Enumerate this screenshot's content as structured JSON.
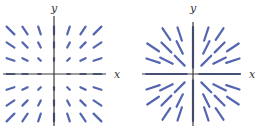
{
  "figure": {
    "panels": [
      {
        "id": "left",
        "title": "",
        "x_label": "x",
        "y_label": "y",
        "origin": [
          54,
          74
        ],
        "x_axis_range_px": [
          3,
          106
        ],
        "y_axis_range_px": [
          16,
          126
        ],
        "grid_spacing_px": 14.5,
        "grid_range": [
          -3,
          3
        ],
        "field": "F(x,y) = (x, y) scaled by magnitude",
        "scale_px": 2.6,
        "color": "#5566b0"
      },
      {
        "id": "right",
        "title": "",
        "x_label": "x",
        "y_label": "y",
        "origin": [
          193,
          74
        ],
        "x_axis_range_px": [
          142,
          241
        ],
        "y_axis_range_px": [
          22,
          126
        ],
        "grid_spacing_px": 14,
        "grid_range": [
          -3,
          3
        ],
        "field": "F(x,y) = (x, y) normalized (unit length)",
        "segment_length_px": 14,
        "max_radius": 3.7,
        "color": "#5566b0"
      }
    ]
  },
  "chart_data": [
    {
      "type": "vector_field",
      "title": "",
      "xlabel": "x",
      "ylabel": "y",
      "field": "radial (x, y), length proportional to magnitude",
      "grid_x": [
        -3,
        -2,
        -1,
        0,
        1,
        2,
        3
      ],
      "grid_y": [
        -3,
        -2,
        -1,
        0,
        1,
        2,
        3
      ]
    },
    {
      "type": "vector_field",
      "title": "",
      "xlabel": "x",
      "ylabel": "y",
      "field": "radial (x, y), uniform length",
      "grid_x": [
        -3,
        -2,
        -1,
        0,
        1,
        2,
        3
      ],
      "grid_y": [
        -3,
        -2,
        -1,
        0,
        1,
        2,
        3
      ]
    }
  ]
}
